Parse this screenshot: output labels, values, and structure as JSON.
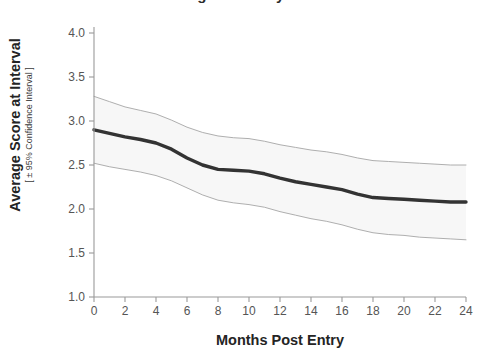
{
  "chart_data": {
    "type": "line",
    "title": "Average Score by Month",
    "xlabel": "Months Post Entry",
    "ylabel": "Average Score at Interval",
    "ylabel_sub": "[ ± 95% Confidence Interval ]",
    "xlim": [
      0,
      24
    ],
    "ylim": [
      1.0,
      4.0
    ],
    "xticks": [
      0,
      2,
      4,
      6,
      8,
      10,
      12,
      14,
      16,
      18,
      20,
      22,
      24
    ],
    "xtick_labels": [
      "0",
      "2",
      "4",
      "6",
      "8",
      "10",
      "12",
      "14",
      "16",
      "18",
      "20",
      "22",
      "24"
    ],
    "yticks": [
      1.0,
      1.5,
      2.0,
      2.5,
      3.0,
      3.5,
      4.0
    ],
    "ytick_labels": [
      "1.0",
      "1.5",
      "2.0",
      "2.5",
      "3.0",
      "3.5",
      "4.0"
    ],
    "grid": false,
    "legend": "none",
    "x": [
      0,
      1,
      2,
      3,
      4,
      5,
      6,
      7,
      8,
      9,
      10,
      11,
      12,
      13,
      14,
      15,
      16,
      17,
      18,
      19,
      20,
      21,
      22,
      23,
      24
    ],
    "series": [
      {
        "name": "Average Score",
        "role": "mean",
        "color": "#333333",
        "linewidth": 3.4,
        "values": [
          2.9,
          2.86,
          2.82,
          2.79,
          2.75,
          2.68,
          2.58,
          2.5,
          2.45,
          2.44,
          2.43,
          2.4,
          2.35,
          2.31,
          2.28,
          2.25,
          2.22,
          2.17,
          2.13,
          2.12,
          2.11,
          2.1,
          2.09,
          2.08,
          2.08
        ]
      },
      {
        "name": "Upper 95% Confidence Limit",
        "role": "ci_upper",
        "color": "#9a9a9a",
        "linewidth": 0.8,
        "values": [
          3.28,
          3.22,
          3.16,
          3.12,
          3.08,
          3.01,
          2.93,
          2.87,
          2.83,
          2.81,
          2.8,
          2.77,
          2.73,
          2.7,
          2.67,
          2.65,
          2.62,
          2.58,
          2.55,
          2.54,
          2.53,
          2.52,
          2.51,
          2.5,
          2.5
        ]
      },
      {
        "name": "Lower 95% Confidence Limit",
        "role": "ci_lower",
        "color": "#9a9a9a",
        "linewidth": 0.8,
        "values": [
          2.52,
          2.48,
          2.45,
          2.42,
          2.38,
          2.32,
          2.24,
          2.16,
          2.1,
          2.07,
          2.05,
          2.02,
          1.97,
          1.93,
          1.89,
          1.86,
          1.82,
          1.77,
          1.73,
          1.71,
          1.7,
          1.68,
          1.67,
          1.66,
          1.65
        ]
      }
    ],
    "band_fill": "#f7f7f7",
    "axis_color": "#9a9a9a",
    "plot_background": "#ffffff"
  }
}
